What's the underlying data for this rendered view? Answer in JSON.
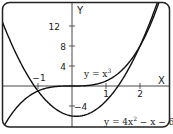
{
  "chart_data": {
    "type": "line",
    "title": "",
    "xlabel": "X",
    "ylabel": "Y",
    "xlim": [
      -2.06,
      2.88
    ],
    "ylim": [
      -8.2,
      16.8
    ],
    "grid": false,
    "legend": "none (curves labeled inline)",
    "x_ticks": [
      {
        "value": -1,
        "label": "-1"
      },
      {
        "value": 1,
        "label": "1"
      },
      {
        "value": 2,
        "label": "2"
      }
    ],
    "y_ticks": [
      {
        "value": 12,
        "label": "12"
      },
      {
        "value": 8,
        "label": "8"
      },
      {
        "value": 4,
        "label": "4"
      },
      {
        "value": -4,
        "label": "-4"
      }
    ],
    "series": [
      {
        "name": "y = x^3",
        "label": "y = x³",
        "expr": "x^3",
        "x": [
          -2,
          -1.5,
          -1,
          -0.5,
          0,
          0.5,
          1,
          1.5,
          2,
          2.5
        ],
        "values": [
          -8,
          -3.375,
          -1,
          -0.125,
          0,
          0.125,
          1,
          3.375,
          8,
          15.625
        ]
      },
      {
        "name": "y = 4x^2 - x - 6",
        "label": "y = 4x² − x − 6",
        "expr": "4x^2-x-6",
        "x": [
          -2,
          -1.5,
          -1,
          -0.5,
          0,
          0.5,
          1,
          1.5,
          2,
          2.5
        ],
        "values": [
          12,
          4.5,
          -1,
          -4.5,
          -6,
          -5.5,
          -3,
          1.5,
          8,
          16.5
        ]
      }
    ],
    "annotations": [
      {
        "text": "y = x³",
        "near": [
          0.55,
          2.4
        ]
      },
      {
        "text": "y = 4x² − x − 6",
        "near": [
          1.5,
          -7.2
        ]
      }
    ]
  },
  "labels": {
    "x_axis": "X",
    "y_axis": "Y",
    "curve1": "y = x",
    "curve1_exp": "3",
    "curve2_a": "y = 4x",
    "curve2_exp": "2",
    "curve2_b": " − x − 6",
    "tick_neg1": "−1",
    "tick_1": "1",
    "tick_2": "2",
    "tick_12": "12",
    "tick_8": "8",
    "tick_4": "4",
    "tick_neg4": "−4"
  }
}
